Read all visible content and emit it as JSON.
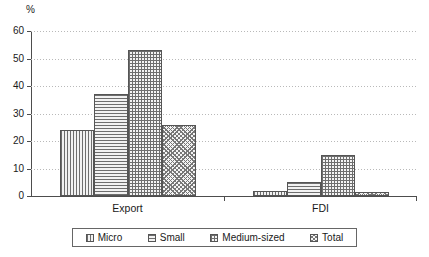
{
  "chart_data": {
    "type": "bar",
    "title": "",
    "subtitle": "",
    "xlabel": "",
    "ylabel": "%",
    "ylim": [
      0,
      60
    ],
    "yticks": [
      0,
      10,
      20,
      30,
      40,
      50,
      60
    ],
    "ytick_labels": [
      "0",
      "10",
      "20",
      "30",
      "40",
      "50",
      "60"
    ],
    "categories": [
      "Export",
      "FDI"
    ],
    "grid": "horizontal-dotted",
    "legend_position": "bottom",
    "series": [
      {
        "name": "Micro",
        "pattern": "vertical-lines",
        "values": [
          24,
          2
        ]
      },
      {
        "name": "Small",
        "pattern": "horizontal-lines",
        "values": [
          37,
          5
        ]
      },
      {
        "name": "Medium-sized",
        "pattern": "cross-hatch",
        "values": [
          53,
          15
        ]
      },
      {
        "name": "Total",
        "pattern": "checkered",
        "values": [
          26,
          1.5
        ]
      }
    ]
  },
  "axis": {
    "unit_label": "%"
  },
  "legend": {
    "items": [
      {
        "label": "Micro"
      },
      {
        "label": "Small"
      },
      {
        "label": "Medium-sized"
      },
      {
        "label": "Total"
      }
    ]
  },
  "colors": {
    "axis": "#4d4d4d",
    "gridline": "#b9b9b9",
    "bar_border": "#555555",
    "bar_fill": "#6e6e6e",
    "background": "#ffffff",
    "text": "#1a1a1a"
  }
}
